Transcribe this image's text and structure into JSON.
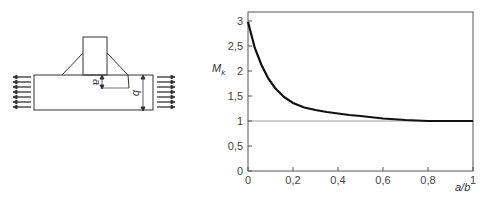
{
  "diagram": {
    "dim_a_label": "a",
    "dim_b_label": "b",
    "arrow_count_per_side": 7
  },
  "chart_data": {
    "type": "line",
    "title": "",
    "xlabel": "a/b",
    "ylabel": "M",
    "ylabel_sub": "k",
    "xlim": [
      0,
      1
    ],
    "ylim": [
      0,
      3.2
    ],
    "x_ticks": [
      0,
      0.2,
      0.4,
      0.6,
      0.8,
      1
    ],
    "x_tick_labels": [
      "0",
      "0,2",
      "0,4",
      "0,6",
      "0,8",
      "1"
    ],
    "y_ticks": [
      0,
      0.5,
      1,
      1.5,
      2,
      2.5,
      3
    ],
    "y_tick_labels": [
      "0",
      "0,5",
      "1",
      "1,5",
      "2",
      "2,5",
      "3"
    ],
    "grid": false,
    "reference_line": {
      "y": 1
    },
    "series": [
      {
        "name": "Mk",
        "x": [
          0,
          0.03,
          0.06,
          0.09,
          0.12,
          0.16,
          0.2,
          0.25,
          0.3,
          0.35,
          0.4,
          0.45,
          0.5,
          0.6,
          0.7,
          0.8,
          0.9,
          1.0
        ],
        "y": [
          2.98,
          2.46,
          2.12,
          1.85,
          1.66,
          1.48,
          1.36,
          1.27,
          1.22,
          1.18,
          1.15,
          1.12,
          1.1,
          1.05,
          1.02,
          1.0,
          1.0,
          1.0
        ]
      }
    ]
  }
}
